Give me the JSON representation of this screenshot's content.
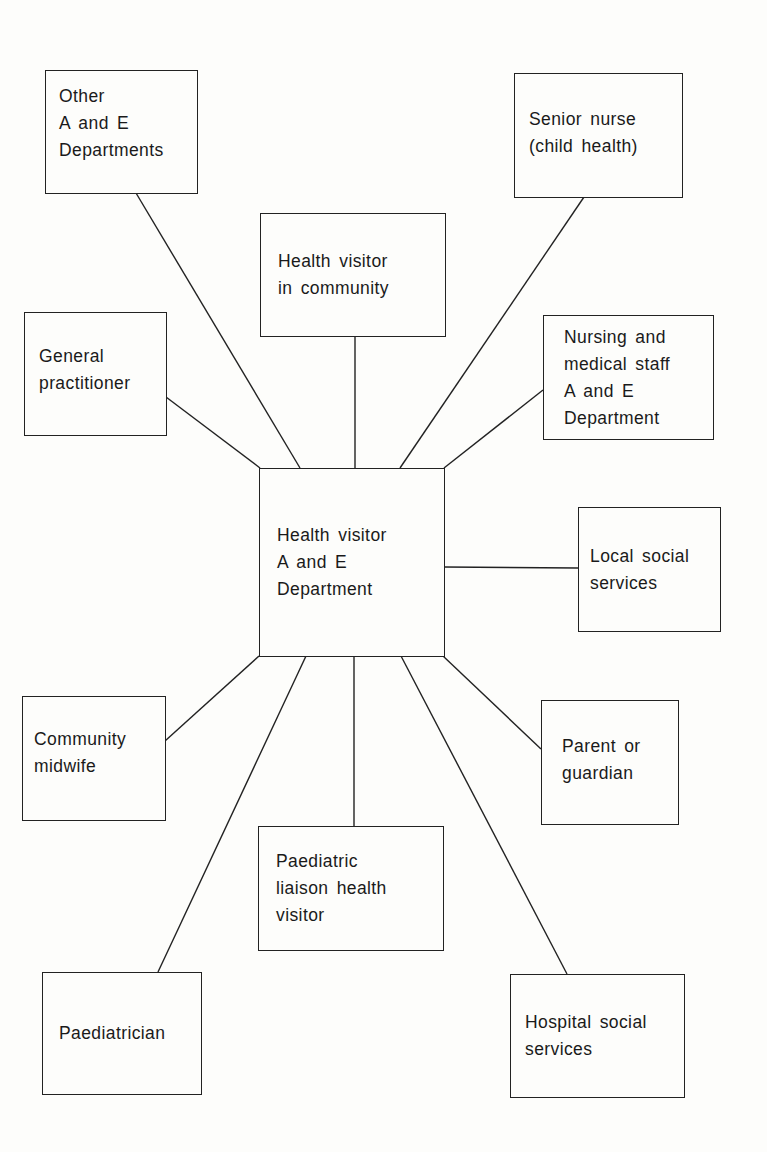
{
  "diagram": {
    "center": {
      "id": "center",
      "lines": [
        "Health visitor",
        "A and E",
        "Department"
      ]
    },
    "nodes": [
      {
        "id": "other-ae",
        "lines": [
          "Other",
          "A and E",
          "Departments"
        ]
      },
      {
        "id": "hv-community",
        "lines": [
          "Health visitor",
          "in community"
        ]
      },
      {
        "id": "senior-nurse",
        "lines": [
          "Senior nurse",
          "(child health)"
        ]
      },
      {
        "id": "gp",
        "lines": [
          "General",
          "practitioner"
        ]
      },
      {
        "id": "nursing-medical",
        "lines": [
          "Nursing and",
          "medical staff",
          "A and E",
          "Department"
        ]
      },
      {
        "id": "local-social",
        "lines": [
          "Local social",
          "services"
        ]
      },
      {
        "id": "midwife",
        "lines": [
          "Community",
          "midwife"
        ]
      },
      {
        "id": "parent",
        "lines": [
          "Parent or",
          "guardian"
        ]
      },
      {
        "id": "liaison",
        "lines": [
          "Paediatric",
          "liaison health",
          "visitor"
        ]
      },
      {
        "id": "paediatrician",
        "lines": [
          "Paediatrician"
        ]
      },
      {
        "id": "hospital-social",
        "lines": [
          "Hospital social",
          "services"
        ]
      }
    ],
    "edges": [
      {
        "from": "center",
        "to": "other-ae"
      },
      {
        "from": "center",
        "to": "hv-community"
      },
      {
        "from": "center",
        "to": "senior-nurse"
      },
      {
        "from": "center",
        "to": "gp"
      },
      {
        "from": "center",
        "to": "nursing-medical"
      },
      {
        "from": "center",
        "to": "local-social"
      },
      {
        "from": "center",
        "to": "midwife"
      },
      {
        "from": "center",
        "to": "parent"
      },
      {
        "from": "center",
        "to": "liaison"
      },
      {
        "from": "center",
        "to": "paediatrician"
      },
      {
        "from": "center",
        "to": "hospital-social"
      }
    ]
  }
}
